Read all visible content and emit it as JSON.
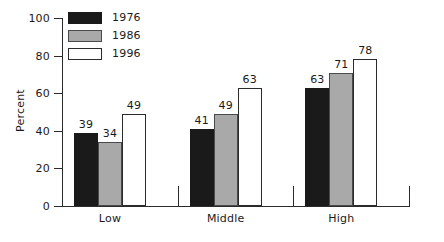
{
  "chart_data": {
    "type": "bar",
    "title": "",
    "xlabel": "",
    "ylabel": "Percent",
    "categories": [
      "Low",
      "Middle",
      "High"
    ],
    "series": [
      {
        "name": "1976",
        "color": "#1a1a1a",
        "values": [
          39,
          41,
          63
        ]
      },
      {
        "name": "1986",
        "color": "#a9a9a9",
        "values": [
          34,
          49,
          71
        ]
      },
      {
        "name": "1996",
        "color": "#ffffff",
        "values": [
          49,
          63,
          78
        ]
      }
    ],
    "ylim": [
      0,
      100
    ],
    "yticks": [
      0,
      20,
      40,
      60,
      80,
      100
    ],
    "ytick_labels": [
      "0",
      "20",
      "40",
      "60",
      "80",
      "100"
    ],
    "grid": false,
    "legend_position": "top-left",
    "data_labels": true
  },
  "axis": {
    "y_title": "Percent"
  }
}
